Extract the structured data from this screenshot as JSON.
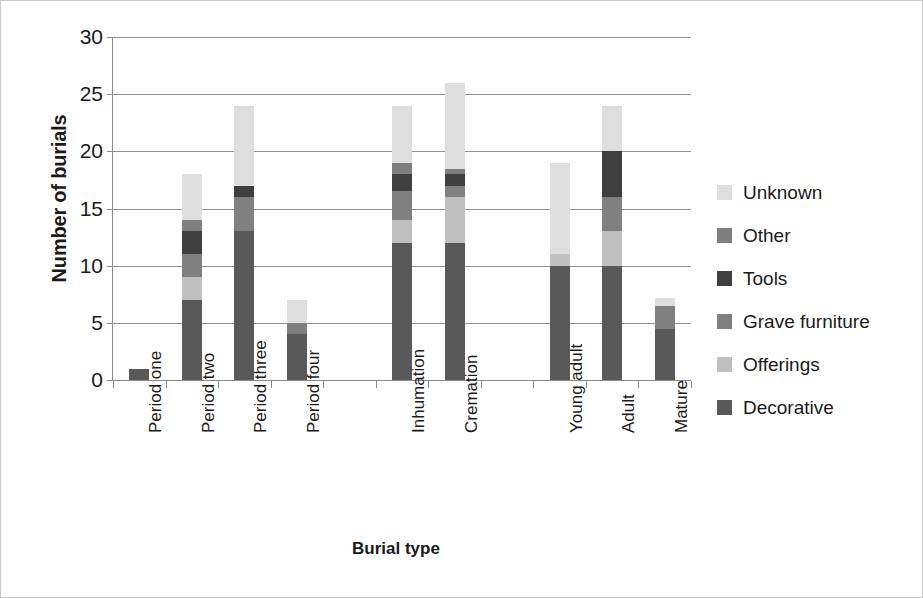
{
  "chart_data": {
    "type": "bar",
    "subtype": "stacked-vertical",
    "title": "",
    "xlabel": "Burial type",
    "ylabel": "Number of burials",
    "ylim": [
      0,
      30
    ],
    "yticks": [
      0,
      5,
      10,
      15,
      20,
      25,
      30
    ],
    "grid": true,
    "legend_position": "right",
    "categories": [
      "Period one",
      "Period two",
      "Period three",
      "Period four",
      "",
      "Inhumation",
      "Cremation",
      "",
      "Young adult",
      "Adult",
      "Mature"
    ],
    "series": [
      {
        "name": "Decorative",
        "color": "#595959",
        "values": [
          1,
          7,
          13,
          4,
          0,
          12,
          12,
          0,
          10,
          10,
          4.5
        ]
      },
      {
        "name": "Offerings",
        "color": "#bfbfbf",
        "values": [
          0,
          2,
          0,
          0,
          0,
          2,
          4,
          0,
          1,
          3,
          0
        ]
      },
      {
        "name": "Grave furniture",
        "color": "#808080",
        "values": [
          0,
          2,
          3,
          1,
          0,
          2.5,
          1,
          0,
          0,
          3,
          2
        ]
      },
      {
        "name": "Tools",
        "color": "#3f3f3f",
        "values": [
          0,
          2,
          1,
          0,
          0,
          1.5,
          1,
          0,
          0,
          4,
          0
        ]
      },
      {
        "name": "Other",
        "color": "#7f7f7f",
        "values": [
          0,
          1,
          0,
          0,
          0,
          1,
          0.5,
          0,
          0,
          0,
          0
        ]
      },
      {
        "name": "Unknown",
        "color": "#dedede",
        "values": [
          0,
          4,
          7,
          2,
          0,
          5,
          7.5,
          0,
          8,
          4,
          0.7
        ]
      }
    ],
    "totals": [
      1,
      18,
      24,
      7,
      0,
      24,
      26,
      0,
      19,
      24,
      7.2
    ]
  },
  "legend": {
    "entries": [
      {
        "label": "Unknown",
        "color": "#dedede"
      },
      {
        "label": "Other",
        "color": "#7f7f7f"
      },
      {
        "label": "Tools",
        "color": "#3f3f3f"
      },
      {
        "label": "Grave furniture",
        "color": "#808080"
      },
      {
        "label": "Offerings",
        "color": "#bfbfbf"
      },
      {
        "label": "Decorative",
        "color": "#595959"
      }
    ]
  }
}
